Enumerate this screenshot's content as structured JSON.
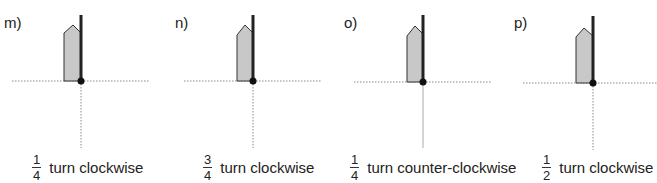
{
  "colors": {
    "shape_fill": "#c8c8c8",
    "shape_stroke": "#333333",
    "bar": "#222222",
    "axis_dotted": "#888888"
  },
  "panels": [
    {
      "id": "m",
      "label": "m)",
      "fraction": {
        "numerator": "1",
        "denominator": "4"
      },
      "instruction": "turn clockwise"
    },
    {
      "id": "n",
      "label": "n)",
      "fraction": {
        "numerator": "3",
        "denominator": "4"
      },
      "instruction": "turn clockwise"
    },
    {
      "id": "o",
      "label": "o)",
      "fraction": {
        "numerator": "1",
        "denominator": "4"
      },
      "instruction": "turn counter-clockwise"
    },
    {
      "id": "p",
      "label": "p)",
      "fraction": {
        "numerator": "1",
        "denominator": "2"
      },
      "instruction": "turn clockwise"
    }
  ]
}
